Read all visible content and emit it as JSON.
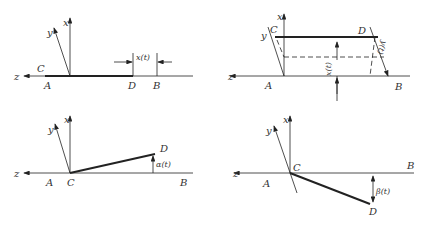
{
  "panels": [
    {
      "id": "translation-x",
      "labels": {
        "x": "x",
        "y": "y",
        "z": "z",
        "A": "A",
        "B": "B",
        "C": "C",
        "D": "D",
        "param": "x(t)"
      }
    },
    {
      "id": "translation-xy",
      "labels": {
        "x": "x",
        "y": "y",
        "z": "z",
        "A": "A",
        "B": "B",
        "C": "C",
        "D": "D",
        "param1": "x(t)",
        "param2": "y(t)"
      }
    },
    {
      "id": "rotation-alpha",
      "labels": {
        "x": "x",
        "y": "y",
        "z": "z",
        "A": "A",
        "B": "B",
        "C": "C",
        "D": "D",
        "param": "α(t)"
      }
    },
    {
      "id": "rotation-beta",
      "labels": {
        "x": "x",
        "y": "y",
        "z": "z",
        "A": "A",
        "B": "B",
        "C": "C",
        "D": "D",
        "param": "β(t)"
      }
    }
  ],
  "colors": {
    "line": "#222222",
    "text": "#333333"
  }
}
